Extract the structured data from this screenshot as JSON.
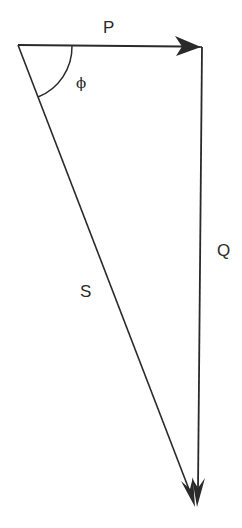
{
  "diagram": {
    "type": "power-triangle",
    "labels": {
      "p": "P",
      "q": "Q",
      "s": "S",
      "angle": "ϕ"
    },
    "colors": {
      "stroke": "#2a2a2a",
      "background": "#ffffff"
    },
    "edges": [
      {
        "name": "P",
        "from": [
          18,
          45
        ],
        "to": [
          201,
          47
        ],
        "arrow": true,
        "arrow_at": "end"
      },
      {
        "name": "Q",
        "from": [
          201,
          47
        ],
        "to": [
          197,
          507
        ],
        "arrow": true,
        "arrow_at": "end"
      },
      {
        "name": "S",
        "from": [
          18,
          45
        ],
        "to": [
          195,
          507
        ],
        "arrow": true,
        "arrow_at": "end"
      }
    ],
    "angle_arc": {
      "vertex": [
        18,
        45
      ],
      "radius": 54,
      "between": [
        "P",
        "S"
      ]
    }
  }
}
